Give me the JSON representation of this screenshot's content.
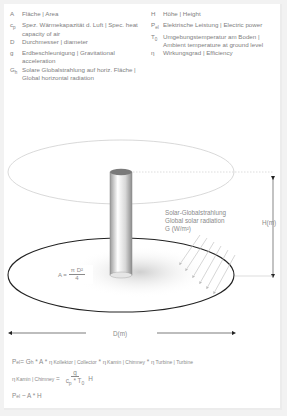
{
  "legend": {
    "left": [
      {
        "symbol": "A",
        "sub": "",
        "text": "Fläche | Area"
      },
      {
        "symbol": "c",
        "sub": "p",
        "text": "Spez. Wärmekapazität d. Luft | Spec. heat capacity of air"
      },
      {
        "symbol": "D",
        "sub": "",
        "text": "Durchmesser | diameter"
      },
      {
        "symbol": "g",
        "sub": "",
        "text": "Erdbeschleunigung | Gravitational acceleration"
      },
      {
        "symbol": "G",
        "sub": "h",
        "text": "Solare Globalstrahlung auf horiz. Fläche | Global horizontal radiation"
      }
    ],
    "right": [
      {
        "symbol": "H",
        "sub": "",
        "text": "Höhe | Height"
      },
      {
        "symbol": "P",
        "sub": "el",
        "text": "Elektrische Leistung | Electric power"
      },
      {
        "symbol": "T",
        "sub": "0",
        "text": "Umgebungstemperatur am Boden | Ambient temperature at ground level"
      },
      {
        "symbol": "η",
        "sub": "",
        "text": "Wirkungsgrad | Efficiency"
      }
    ]
  },
  "diagram": {
    "radiation_label": [
      "Solar-Globalstrahlung",
      "Global solar radiation",
      "G (W/m²)"
    ],
    "height_label": "H(m)",
    "diameter_label": "D(m)",
    "area_formula": {
      "lhs": "A =",
      "numerator": "π D²",
      "denominator": "4"
    },
    "colors": {
      "outline": "#222222",
      "light_outline": "#c8c8c8",
      "tower_top": "#7a7a7a"
    }
  },
  "formulas": {
    "power": {
      "lhs": "P",
      "lhs_sub": "el",
      "eq": " = G",
      "g_sub": "h",
      "mid": " * A * ",
      "eta1": "Kollektor | Collector",
      "eta2": "Kamin | Chimney",
      "eta3": "Turbine | Turbine",
      "times": " * "
    },
    "chimney": {
      "eta_sub": "Kamin | Chimney",
      "eq": " = ",
      "numerator": "g",
      "den_c": "c",
      "den_c_sub": "p",
      "den_mid": " * T",
      "den_t_sub": "0",
      "suffix": "H"
    },
    "proportional": {
      "lhs": "P",
      "lhs_sub": "el",
      "rhs": " ~ A * H"
    }
  }
}
